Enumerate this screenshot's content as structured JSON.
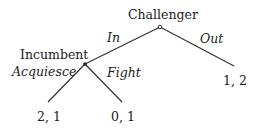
{
  "diagram": {
    "type": "game-tree",
    "nodes": {
      "root": {
        "label": "Challenger"
      },
      "incumbent": {
        "label": "Incumbent"
      }
    },
    "actions": {
      "in": "In",
      "out": "Out",
      "acquiesce": "Acquiesce",
      "fight": "Fight"
    },
    "payoffs": {
      "out": "1, 2",
      "acquiesce": "2, 1",
      "fight": "0, 1"
    },
    "colors": {
      "line": "#333333",
      "text": "#222222"
    }
  }
}
